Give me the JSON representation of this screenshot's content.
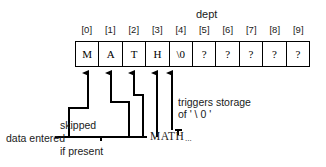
{
  "diagram": {
    "title": "dept",
    "array_name": "dept",
    "indices": [
      "[0]",
      "[1]",
      "[2]",
      "[3]",
      "[4]",
      "[5]",
      "[6]",
      "[7]",
      "[8]",
      "[9]"
    ],
    "cells": [
      "M",
      "A",
      "T",
      "H",
      "\\0",
      "?",
      "?",
      "?",
      "?",
      "?"
    ],
    "annotations": {
      "trigger_line1": "triggers storage",
      "trigger_line2": "of ' \\ 0 '",
      "data_entered": "data entered",
      "skipped": "skipped",
      "if_present": "if present",
      "typed_input": "MATH",
      "ellipsis": "..."
    },
    "colors": {
      "ink": "#000000",
      "text": "#1a1a1a",
      "background": "#ffffff"
    }
  }
}
